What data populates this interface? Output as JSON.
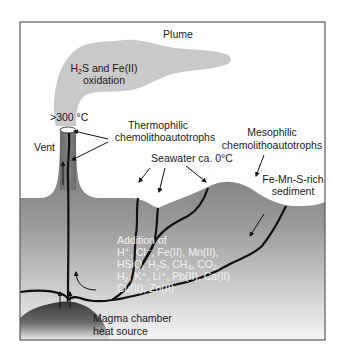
{
  "diagram": {
    "labels": {
      "plume": "Plume",
      "plume_process_line1_pre": "H",
      "plume_process_line1_sub": "2",
      "plume_process_line1_post": "S and Fe(II)",
      "plume_process_line2": "oxidation",
      "temperature": ">300 °C",
      "vent": "Vent",
      "thermophilic_line1": "Thermophilic",
      "thermophilic_line2": "chemolithoautotrophs",
      "mesophilic_line1": "Mesophilic",
      "mesophilic_line2": "chemolithoautotrophs",
      "seawater": "Seawater ca. 0°C",
      "sediment_line1": "Fe-Mn-S-rich",
      "sediment_line2": "sediment",
      "addition_title": "Addition of",
      "addition_line1": "H⁺, Cl⁻, Fe(II), Mn(II),",
      "addition_line2_a": "HSiO, H",
      "addition_line2_sub1": "2",
      "addition_line2_b": "S, CH",
      "addition_line2_sub2": "4",
      "addition_line2_c": ", CO",
      "addition_line2_sub3": "2",
      "addition_line2_d": ",",
      "addition_line3_a": "H",
      "addition_line3_sub": "2",
      "addition_line3_b": ", K⁺, Li⁺, Pb(II), Ca(II)",
      "addition_line4": "Cu(II), Zn(II)",
      "magma_line1": "Magma chamber",
      "magma_line2": "heat source"
    },
    "colors": {
      "frame": "#5a5a5a",
      "plume": "#c8c8c8",
      "crust_top": "#6f6f6f",
      "crust_bottom": "#f4f4f4",
      "magma_top": "#3c3c3c",
      "magma_bottom": "#e8e8e8",
      "flow_paths": "#111111",
      "chimney": "#7a7a7a"
    }
  }
}
